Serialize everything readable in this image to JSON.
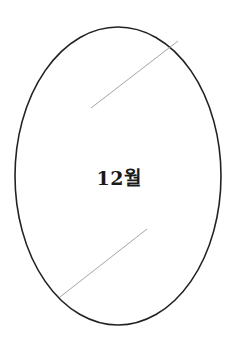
{
  "diagram": {
    "center_label": "12월",
    "colors": {
      "outline": "#222222",
      "line": "#9a9a9a",
      "text": "#1a1a1a",
      "background": "#ffffff"
    },
    "ellipse": {
      "cx": 118,
      "cy": 176,
      "rx": 103,
      "ry": 149
    },
    "lines": [
      {
        "x1": 91,
        "y1": 108,
        "x2": 178,
        "y2": 41
      },
      {
        "x1": 60,
        "y1": 297,
        "x2": 147,
        "y2": 229
      }
    ]
  }
}
